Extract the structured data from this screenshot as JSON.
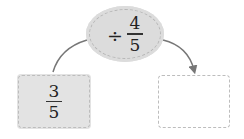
{
  "operation": {
    "operator": "÷",
    "operand": {
      "numerator": "4",
      "denominator": "5"
    }
  },
  "input_box": {
    "value": {
      "numerator": "3",
      "denominator": "5"
    }
  },
  "output_box": {
    "value": ""
  },
  "colors": {
    "fill_gray": "#dcdcdc",
    "dash_border": "#bdbdbd",
    "arrow": "#777777",
    "text": "#222222"
  }
}
